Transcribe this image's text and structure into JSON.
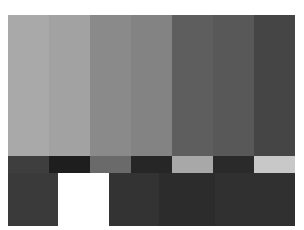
{
  "top_bars": [
    {
      "name": "bar-1",
      "color": "#a9a9a9",
      "width": 41
    },
    {
      "name": "bar-2",
      "color": "#a2a2a2",
      "width": 41
    },
    {
      "name": "bar-3",
      "color": "#8a8a8a",
      "width": 41
    },
    {
      "name": "bar-4",
      "color": "#838383",
      "width": 41
    },
    {
      "name": "bar-5",
      "color": "#5e5e5e",
      "width": 41
    },
    {
      "name": "bar-6",
      "color": "#585858",
      "width": 41
    },
    {
      "name": "bar-7",
      "color": "#454545",
      "width": 41
    }
  ],
  "middle_bars": [
    {
      "name": "mid-1",
      "color": "#3e3e3e",
      "width": 41
    },
    {
      "name": "mid-2",
      "color": "#1e1e1e",
      "width": 41
    },
    {
      "name": "mid-3",
      "color": "#6a6a6a",
      "width": 41
    },
    {
      "name": "mid-4",
      "color": "#262626",
      "width": 41
    },
    {
      "name": "mid-5",
      "color": "#a8a8a8",
      "width": 41
    },
    {
      "name": "mid-6",
      "color": "#2a2a2a",
      "width": 41
    },
    {
      "name": "mid-7",
      "color": "#c8c8c8",
      "width": 41
    }
  ],
  "bottom_blocks": [
    {
      "name": "bottom-1",
      "color": "#3a3a3a",
      "width": 50
    },
    {
      "name": "bottom-white",
      "color": "#ffffff",
      "width": 51
    },
    {
      "name": "bottom-3",
      "color": "#333333",
      "width": 50
    },
    {
      "name": "bottom-4",
      "color": "#2c2c2c",
      "width": 56
    },
    {
      "name": "bottom-5",
      "color": "#303030",
      "width": 80
    }
  ]
}
